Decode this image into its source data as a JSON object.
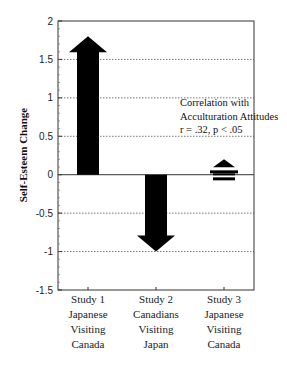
{
  "chart_data": {
    "type": "bar",
    "style": "arrows",
    "title": "",
    "xlabel": "",
    "ylabel": "Self-Esteem Change",
    "ylim": [
      -1.5,
      2
    ],
    "yticks": [
      "2",
      "1.5",
      "1",
      "0.5",
      "0",
      "-0.5",
      "-1",
      "-1.5"
    ],
    "ytick_values": [
      2,
      1.5,
      1,
      0.5,
      0,
      -0.5,
      -1,
      -1.5
    ],
    "grid": "horizontal dotted at 0.5 intervals",
    "categories": [
      [
        "Study 1",
        "Japanese",
        "Visiting",
        "Canada"
      ],
      [
        "Study 2",
        "Canadians",
        "Visiting",
        "Japan"
      ],
      [
        "Study 3",
        "Japanese",
        "Visiting",
        "Canada"
      ]
    ],
    "values": [
      1.8,
      -1.0,
      0.2
    ],
    "annotation": [
      "Correlation with",
      "Acculturation Attitudes",
      "r = .32, p < .05"
    ]
  }
}
